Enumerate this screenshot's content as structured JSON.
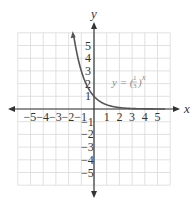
{
  "chart_data": {
    "type": "line",
    "title": "",
    "xlabel": "x",
    "ylabel": "y",
    "xlim": [
      -6,
      6
    ],
    "ylim": [
      -6,
      6
    ],
    "grid": true,
    "x_ticks": [
      -5,
      -4,
      -3,
      -2,
      -1,
      1,
      2,
      3,
      4,
      5
    ],
    "y_ticks": [
      -5,
      -4,
      -3,
      -2,
      -1,
      1,
      2,
      3,
      4,
      5
    ],
    "x_tick_labels": [
      "−5",
      "−4",
      "−3",
      "−2",
      "−1",
      "1",
      "2",
      "3",
      "4",
      "5"
    ],
    "y_tick_labels": [
      "−5",
      "−4",
      "−3",
      "−2",
      "−1",
      "1",
      "2",
      "3",
      "4",
      "5"
    ],
    "series": [
      {
        "name": "y = (1/3)^x",
        "function": "(1/3)^x",
        "x": [
          -1.6,
          -1.5,
          -1.25,
          -1,
          -0.75,
          -0.5,
          -0.25,
          0,
          0.5,
          1,
          1.5,
          2,
          3,
          4,
          5,
          5.5
        ],
        "values": [
          5.8,
          5.2,
          3.95,
          3.0,
          2.28,
          1.73,
          1.32,
          1.0,
          0.58,
          0.33,
          0.19,
          0.11,
          0.04,
          0.01,
          0.004,
          0.002
        ]
      }
    ],
    "annotations": [
      {
        "text": "y = (1/3)^x",
        "x": 2.6,
        "y": 2.0
      }
    ]
  },
  "labels": {
    "x_axis": "x",
    "y_axis": "y",
    "equation_prefix": "y = (",
    "equation_num": "1",
    "equation_den": "3",
    "equation_suffix": ")",
    "equation_exp": "x"
  },
  "colors": {
    "grid": "#d9d9d9",
    "axis": "#333333",
    "curve": "#555555",
    "annotation": "#8a8a8a"
  }
}
